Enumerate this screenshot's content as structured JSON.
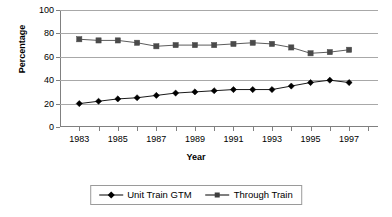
{
  "chart_data": {
    "type": "line",
    "title": "",
    "xlabel": "Year",
    "ylabel": "Percentage",
    "x": [
      1983,
      1984,
      1985,
      1986,
      1987,
      1988,
      1989,
      1990,
      1991,
      1992,
      1993,
      1994,
      1995,
      1996,
      1997
    ],
    "xlim": [
      1982,
      1998.5
    ],
    "ylim": [
      0,
      100
    ],
    "ytick_labels": [
      "0",
      "20",
      "40",
      "60",
      "80",
      "100"
    ],
    "yticks": [
      0,
      20,
      40,
      60,
      80,
      100
    ],
    "xtick_labels": [
      "1983",
      "1985",
      "1987",
      "1989",
      "1991",
      "1993",
      "1995",
      "1997"
    ],
    "xticks": [
      1983,
      1985,
      1987,
      1989,
      1991,
      1993,
      1995,
      1997
    ],
    "grid": "horizontal",
    "legend_position": "bottom",
    "series": [
      {
        "name": "Unit Train GTM",
        "marker": "diamond",
        "color": "#000000",
        "values": [
          20,
          22,
          24,
          25,
          27,
          29,
          30,
          31,
          32,
          32,
          32,
          35,
          38,
          40,
          38
        ]
      },
      {
        "name": "Through Train",
        "marker": "square",
        "color": "#4a4a4a",
        "values": [
          75,
          74,
          74,
          72,
          69,
          70,
          70,
          70,
          71,
          72,
          71,
          68,
          63,
          64,
          66
        ]
      }
    ]
  },
  "axes": {
    "y_title": "Percentage",
    "x_title": "Year"
  },
  "legend": {
    "entries": [
      {
        "label": "Unit Train GTM"
      },
      {
        "label": "Through Train"
      }
    ]
  }
}
